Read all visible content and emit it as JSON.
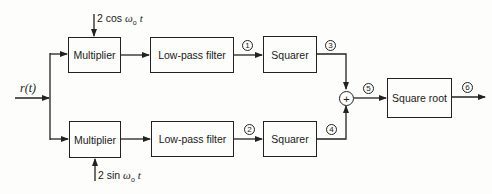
{
  "diagram": {
    "input": {
      "label": "r(t)"
    },
    "top_branch": {
      "reference": {
        "prefix": "2 cos ",
        "omega": "ω",
        "sub": "o",
        "suffix": "t"
      },
      "multiplier": "Multiplier",
      "filter": "Low-pass filter",
      "squarer": "Squarer",
      "node_after_filter": "1",
      "node_after_squarer": "3"
    },
    "bottom_branch": {
      "reference": {
        "prefix": "2 sin ",
        "omega": "ω",
        "sub": "o",
        "suffix": "t"
      },
      "multiplier": "Multiplier",
      "filter": "Low-pass filter",
      "squarer": "Squarer",
      "node_after_filter": "2",
      "node_after_squarer": "4"
    },
    "summer": {
      "symbol": "+",
      "node_after": "5"
    },
    "square_root": {
      "label": "Square root",
      "node_after": "6"
    }
  }
}
